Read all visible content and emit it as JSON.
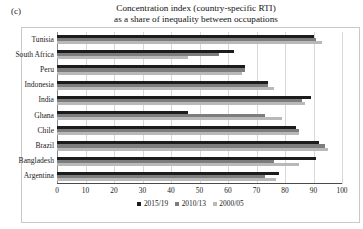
{
  "panel": {
    "label": "(c)"
  },
  "title": {
    "line1": "Concentration index (country-specific RTI)",
    "line2": "as a share of inequality between occupations"
  },
  "legend": {
    "position": "bottom-center",
    "items": [
      {
        "label": "2015/19",
        "color": "#1c1c1c"
      },
      {
        "label": "2010/13",
        "color": "#7d7d7d"
      },
      {
        "label": "2000/05",
        "color": "#b9b9b9"
      }
    ]
  },
  "axis": {
    "ticks": [
      "0",
      "10",
      "20",
      "30",
      "40",
      "50",
      "60",
      "70",
      "80",
      "90",
      "100"
    ]
  },
  "chart_data": {
    "type": "bar",
    "orientation": "horizontal",
    "title": "Concentration index (country-specific RTI) as a share of inequality between occupations",
    "xlabel": "",
    "ylabel": "",
    "xlim": [
      0,
      100
    ],
    "xticks": [
      0,
      10,
      20,
      30,
      40,
      50,
      60,
      70,
      80,
      90,
      100
    ],
    "grid": true,
    "legend_position": "bottom-center",
    "categories": [
      "Tunisia",
      "South Africa",
      "Peru",
      "Indonesia",
      "India",
      "Ghana",
      "Chile",
      "Brazil",
      "Bangladesh",
      "Argentina"
    ],
    "series": [
      {
        "name": "2015/19",
        "color": "#1c1c1c",
        "values": [
          90,
          62,
          66,
          74,
          89,
          46,
          84,
          92,
          91,
          78
        ]
      },
      {
        "name": "2010/13",
        "color": "#7d7d7d",
        "values": [
          91,
          57,
          66,
          74,
          86,
          73,
          85,
          94,
          76,
          73
        ]
      },
      {
        "name": "2000/05",
        "color": "#b9b9b9",
        "values": [
          93,
          46,
          65,
          76,
          87,
          79,
          85,
          95,
          85,
          77
        ]
      }
    ]
  }
}
